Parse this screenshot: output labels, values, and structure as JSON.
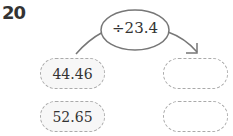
{
  "problem_number": "20",
  "operation": "÷23.4",
  "inputs": [
    "44.46",
    "52.65"
  ],
  "outputs": [
    "",
    ""
  ],
  "colors": {
    "border": "#aaaaaa",
    "text": "#333333"
  }
}
